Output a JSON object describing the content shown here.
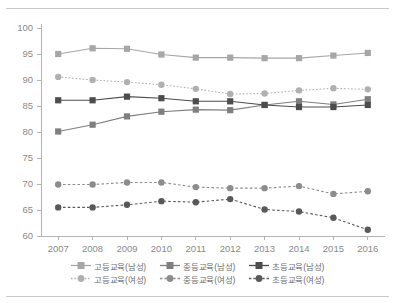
{
  "chart_data": {
    "type": "line",
    "title": "",
    "subtitle": "",
    "xlabel": "",
    "ylabel": "",
    "categories": [
      "2007",
      "2008",
      "2009",
      "2010",
      "2011",
      "2012",
      "2013",
      "2014",
      "2015",
      "2016"
    ],
    "x": [
      2007,
      2008,
      2009,
      2010,
      2011,
      2012,
      2013,
      2014,
      2015,
      2016
    ],
    "ylim": [
      60,
      100
    ],
    "yticks": [
      60,
      65,
      70,
      75,
      80,
      85,
      90,
      95,
      100
    ],
    "ytick_labels": [
      "60",
      "65",
      "70",
      "75",
      "80",
      "85",
      "90",
      "95",
      "100"
    ],
    "grid": false,
    "legend_position": "bottom",
    "legend_columns": 3,
    "legend_rows": 2,
    "series": [
      {
        "name": "고등교육(남성)",
        "values": [
          95.0,
          96.1,
          96.0,
          94.9,
          94.3,
          94.3,
          94.2,
          94.2,
          94.7,
          95.2
        ],
        "color": "#a6a6a6",
        "marker": "square",
        "line_style": "solid"
      },
      {
        "name": "중등교육(남성)",
        "values": [
          80.1,
          81.4,
          83.0,
          83.9,
          84.3,
          84.2,
          85.2,
          85.9,
          85.3,
          86.3
        ],
        "color": "#7f7f7f",
        "marker": "square",
        "line_style": "solid"
      },
      {
        "name": "초등교육(남성)",
        "values": [
          86.1,
          86.1,
          86.8,
          86.5,
          85.9,
          85.9,
          85.2,
          84.8,
          84.8,
          85.2
        ],
        "color": "#4d4d4d",
        "marker": "square",
        "line_style": "solid"
      },
      {
        "name": "고등교육(여성)",
        "values": [
          90.6,
          90.0,
          89.6,
          89.1,
          88.3,
          87.3,
          87.4,
          88.0,
          88.4,
          88.2
        ],
        "color": "#b0b0b0",
        "marker": "circle",
        "line_style": "dotted"
      },
      {
        "name": "중등교육(여성)",
        "values": [
          69.9,
          69.9,
          70.3,
          70.3,
          69.4,
          69.2,
          69.2,
          69.6,
          68.1,
          68.6
        ],
        "color": "#8c8c8c",
        "marker": "circle",
        "line_style": "dashed"
      },
      {
        "name": "초등교육(여성)",
        "values": [
          65.5,
          65.5,
          66.0,
          66.7,
          66.5,
          67.1,
          65.1,
          64.7,
          63.5,
          61.2
        ],
        "color": "#595959",
        "marker": "circle",
        "line_style": "dashed"
      }
    ]
  },
  "legend": {
    "row1": [
      "고등교육(남성)",
      "중등교육(남성)",
      "초등교육(남성)"
    ],
    "row2": [
      "고등교육(여성)",
      "중등교육(여성)",
      "초등교육(여성)"
    ]
  }
}
